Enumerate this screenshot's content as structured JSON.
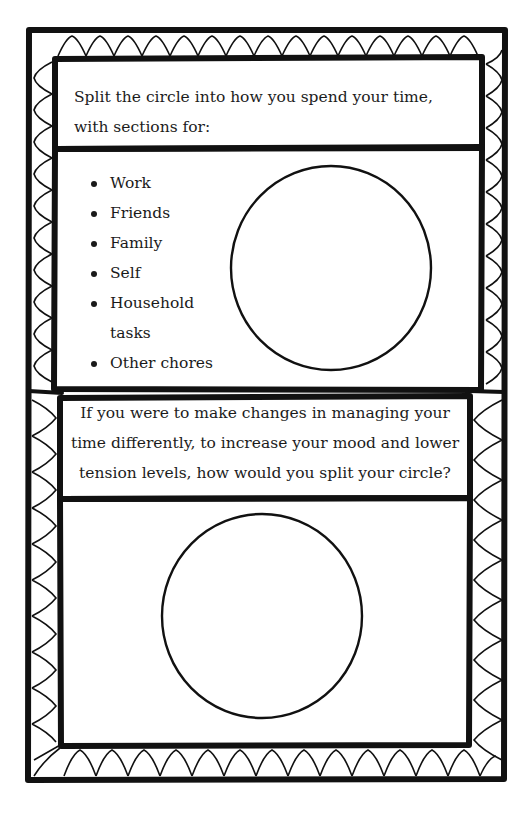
{
  "worksheet": {
    "section_1": {
      "prompt": "Split the circle into how you spend your time, with sections for:",
      "prompt_lines": [
        "Split the circle into how you spend your time,",
        "with sections for:"
      ],
      "categories": [
        {
          "label": "Work"
        },
        {
          "label": "Friends"
        },
        {
          "label": "Family"
        },
        {
          "label": "Self"
        },
        {
          "label": "Household",
          "continuation": "tasks"
        },
        {
          "label": "Other chores"
        }
      ],
      "circle": {
        "cx": 331,
        "cy": 268,
        "r": 100
      }
    },
    "section_2": {
      "prompt": "If you were to make changes in managing your time differently, to increase your mood and lower tension levels, how would you split your circle?",
      "prompt_lines": [
        "If you were to make changes in managing your",
        "time differently, to increase your mood and lower",
        "tension levels, how would you split your circle?"
      ],
      "circle": {
        "cx": 262,
        "cy": 616,
        "r": 100
      }
    },
    "colors": {
      "ink": "#111111",
      "paper": "#ffffff"
    }
  }
}
